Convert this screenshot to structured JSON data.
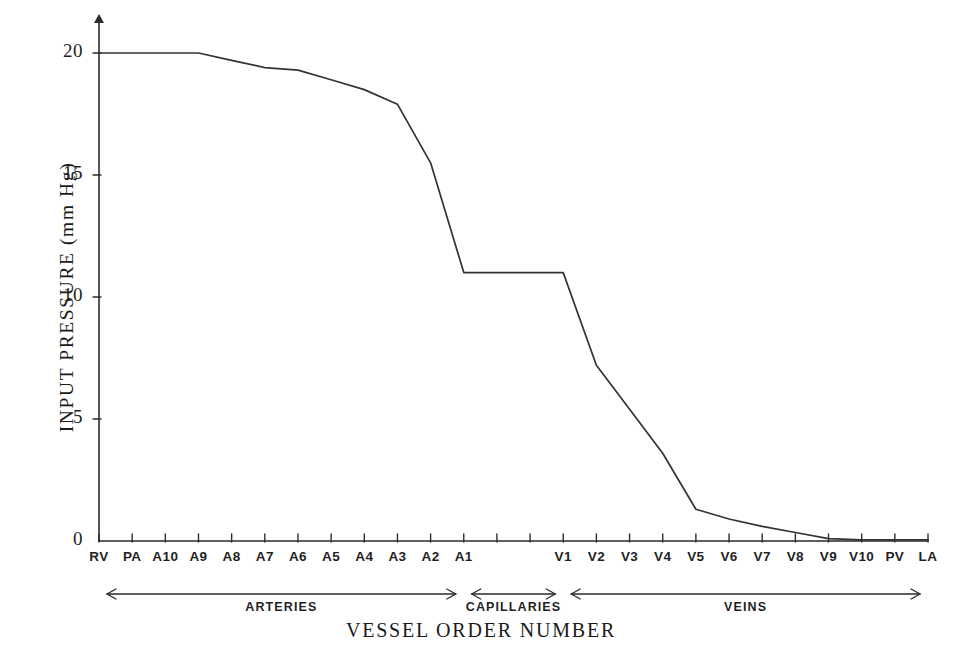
{
  "chart_data": {
    "type": "line",
    "title": "",
    "xlabel": "VESSEL ORDER NUMBER",
    "ylabel": "INPUT PRESSURE (mm Hg)",
    "ylim": [
      0,
      21.5
    ],
    "yticks": [
      0,
      5,
      10,
      15,
      20
    ],
    "ytick_labels": [
      "0",
      "5",
      "10",
      "15",
      "20"
    ],
    "grid": false,
    "legend": "none",
    "categories": [
      "RV",
      "PA",
      "A10",
      "A9",
      "A8",
      "A7",
      "A6",
      "A5",
      "A4",
      "A3",
      "A2",
      "A1",
      "C1",
      "C2",
      "V1",
      "V2",
      "V3",
      "V4",
      "V5",
      "V6",
      "V7",
      "V8",
      "V9",
      "V10",
      "PV",
      "LA"
    ],
    "tick_labels": [
      "RV",
      "PA",
      "A10",
      "A9",
      "A8",
      "A7",
      "A6",
      "A5",
      "A4",
      "A3",
      "A2",
      "A1",
      "",
      "",
      "V1",
      "V2",
      "V3",
      "V4",
      "V5",
      "V6",
      "V7",
      "V8",
      "V9",
      "V10",
      "PV",
      "LA"
    ],
    "values": [
      20.0,
      20.0,
      20.0,
      20.0,
      19.7,
      19.4,
      19.3,
      18.9,
      18.5,
      17.9,
      15.5,
      11.0,
      11.0,
      11.0,
      11.0,
      7.2,
      5.4,
      3.6,
      1.3,
      0.9,
      0.6,
      0.35,
      0.1,
      0.05,
      0.05,
      0.05
    ],
    "series": [
      {
        "name": "input pressure",
        "values": [
          20.0,
          20.0,
          20.0,
          20.0,
          19.7,
          19.4,
          19.3,
          18.9,
          18.5,
          17.9,
          15.5,
          11.0,
          11.0,
          11.0,
          11.0,
          7.2,
          5.4,
          3.6,
          1.3,
          0.9,
          0.6,
          0.35,
          0.1,
          0.05,
          0.05,
          0.05
        ]
      }
    ],
    "spans": [
      {
        "label": "ARTERIES",
        "from": "RV",
        "to": "A1"
      },
      {
        "label": "CAPILLARIES",
        "from": "A1",
        "to": "V1"
      },
      {
        "label": "VEINS",
        "from": "V1",
        "to": "LA"
      }
    ]
  },
  "axis": {
    "y_label": "INPUT PRESSURE (mm Hg)",
    "x_label": "VESSEL ORDER NUMBER",
    "ytick_0": "0",
    "ytick_5": "5",
    "ytick_10": "10",
    "ytick_15": "15",
    "ytick_20": "20"
  },
  "xticks": [
    {
      "label": "RV"
    },
    {
      "label": "PA"
    },
    {
      "label": "A10"
    },
    {
      "label": "A9"
    },
    {
      "label": "A8"
    },
    {
      "label": "A7"
    },
    {
      "label": "A6"
    },
    {
      "label": "A5"
    },
    {
      "label": "A4"
    },
    {
      "label": "A3"
    },
    {
      "label": "A2"
    },
    {
      "label": "A1"
    },
    {
      "label": "V1"
    },
    {
      "label": "V2"
    },
    {
      "label": "V3"
    },
    {
      "label": "V4"
    },
    {
      "label": "V5"
    },
    {
      "label": "V6"
    },
    {
      "label": "V7"
    },
    {
      "label": "V8"
    },
    {
      "label": "V9"
    },
    {
      "label": "V10"
    },
    {
      "label": "PV"
    },
    {
      "label": "LA"
    }
  ],
  "spans": [
    {
      "label": "ARTERIES"
    },
    {
      "label": "CAPILLARIES"
    },
    {
      "label": "VEINS"
    }
  ],
  "colors": {
    "background": "#ffffff",
    "ink": "#2b2b2b",
    "curve": "#333333"
  }
}
